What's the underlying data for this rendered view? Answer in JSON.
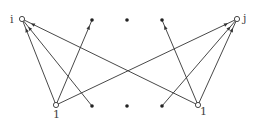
{
  "diagram": {
    "nodes": [
      {
        "id": "i",
        "kind": "open",
        "label": "i",
        "label_side": "left"
      },
      {
        "id": "t1",
        "kind": "dot",
        "label": ""
      },
      {
        "id": "t2",
        "kind": "dot",
        "label": ""
      },
      {
        "id": "t3",
        "kind": "dot",
        "label": ""
      },
      {
        "id": "j",
        "kind": "open",
        "label": "j",
        "label_side": "right"
      },
      {
        "id": "bl",
        "kind": "open",
        "label": "1",
        "label_side": "below"
      },
      {
        "id": "b1",
        "kind": "dot",
        "label": ""
      },
      {
        "id": "b2",
        "kind": "dot",
        "label": ""
      },
      {
        "id": "b3",
        "kind": "dot",
        "label": ""
      },
      {
        "id": "br",
        "kind": "open",
        "label": "1",
        "label_side": "below-right"
      }
    ],
    "edges": [
      {
        "from": "bl",
        "to": "i"
      },
      {
        "from": "b1",
        "to": "i"
      },
      {
        "from": "br",
        "to": "i"
      },
      {
        "from": "bl",
        "to": "t1"
      },
      {
        "from": "bl",
        "to": "j"
      },
      {
        "from": "br",
        "to": "t3"
      },
      {
        "from": "b3",
        "to": "j"
      },
      {
        "from": "br",
        "to": "j"
      }
    ],
    "colors": {
      "stroke": "#333333",
      "dot": "#222222",
      "label": "#444444"
    }
  }
}
